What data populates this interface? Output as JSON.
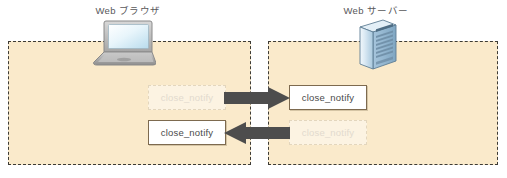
{
  "diagram": {
    "title_browser": "Web ブラウザ",
    "title_server": "Web サーバー",
    "colors": {
      "zone_fill": "#faeacb",
      "zone_border": "#3d3b35",
      "arrow_fill": "#4d4d4d",
      "box_border": "#7d6a4f",
      "box_fill": "#ffffff",
      "ghost_text": "#e2dace",
      "text": "#4a4a4a",
      "title_text": "#58585a",
      "laptop_screen": "#cfe8f5",
      "server_body": "#b9d4e8"
    },
    "client_zone": {
      "messages": [
        {
          "label": "close_notify",
          "state": "ghost"
        },
        {
          "label": "close_notify",
          "state": "solid"
        }
      ]
    },
    "server_zone": {
      "messages": [
        {
          "label": "close_notify",
          "state": "solid"
        },
        {
          "label": "close_notify",
          "state": "ghost"
        }
      ]
    },
    "arrows": [
      {
        "name": "close-notify-to-server",
        "direction": "right"
      },
      {
        "name": "close-notify-to-client",
        "direction": "left"
      }
    ]
  }
}
